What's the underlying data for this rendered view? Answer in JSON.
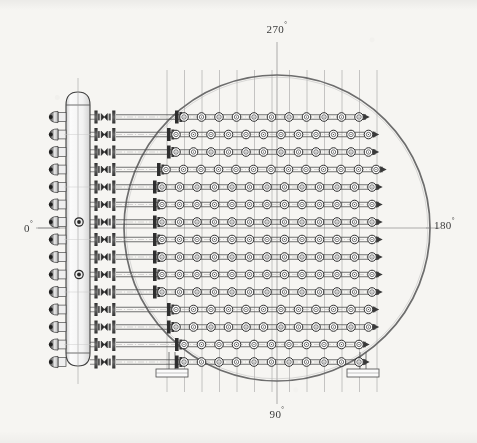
{
  "drawing": {
    "title": "Heat exchanger tube bundle layout — end view",
    "background_color": "#f6f5f2",
    "line_color": "#4a4a4a",
    "shell_color": "#6d6d6d",
    "centerline_color": "#9a9a9a"
  },
  "orientation_labels": [
    {
      "id": "top",
      "text": "270",
      "degree_symbol": "°",
      "x": 277,
      "y": 33,
      "anchor": "middle"
    },
    {
      "id": "right",
      "text": "180",
      "degree_symbol": "°",
      "x": 434,
      "y": 229,
      "anchor": "start"
    },
    {
      "id": "bottom",
      "text": "90",
      "degree_symbol": "°",
      "x": 277,
      "y": 418,
      "anchor": "middle"
    },
    {
      "id": "left",
      "text": "0",
      "degree_symbol": "°",
      "x": 24,
      "y": 232,
      "anchor": "start"
    }
  ],
  "shell": {
    "center_x": 277,
    "center_y": 228,
    "radius": 153,
    "stroke_width": 1.7
  },
  "header": {
    "x": 66,
    "y_top": 92,
    "y_bottom": 366,
    "width": 24,
    "cap_height": 13,
    "nozzle_count": 15,
    "port_marker_rows": [
      6,
      9
    ],
    "label": "distribution header"
  },
  "tube_rows": {
    "count": 15,
    "first_y": 117,
    "spacing": 17.5,
    "tube_gap": 4.5,
    "valve_x": 96,
    "valve_span": 20,
    "marker_counts": [
      11,
      12,
      12,
      13,
      13,
      13,
      13,
      13,
      13,
      13,
      13,
      12,
      12,
      11,
      11
    ],
    "marker_start_x": [
      184,
      176,
      176,
      166,
      162,
      162,
      162,
      162,
      162,
      162,
      162,
      176,
      176,
      184,
      184
    ],
    "marker_spacing": 17.5,
    "marker_outer_r": 4.3,
    "marker_inner_r": 2.2,
    "row_end_arrow": true
  },
  "vertical_centerlines": {
    "count": 13,
    "first_x": 167,
    "spacing": 17.5,
    "y_top": 70,
    "y_bottom": 392
  },
  "supports": [
    {
      "id": "left-saddle",
      "x": 172,
      "y_top": 352,
      "y_bottom": 369,
      "plate_w": 32,
      "plate_h": 8
    },
    {
      "id": "right-saddle",
      "x": 363,
      "y_top": 352,
      "y_bottom": 369,
      "plate_w": 32,
      "plate_h": 8
    }
  ],
  "axes": {
    "horizontal_y": 228,
    "horizontal_x1": 38,
    "horizontal_x2": 440,
    "vertical_x": 277,
    "vertical_y1": 42,
    "vertical_y2": 404
  }
}
